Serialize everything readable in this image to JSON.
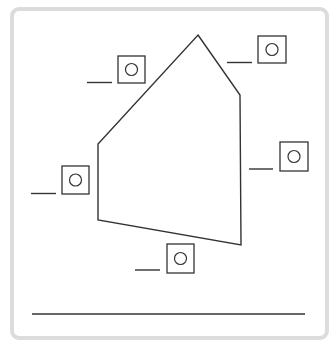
{
  "worksheet": {
    "frame": {
      "x": 10,
      "y": 7,
      "width": 319,
      "height": 333,
      "border_color": "#dcdcdc"
    },
    "stroke_color": "#333333",
    "polygon": {
      "name": "pentagon",
      "vertices": [
        [
          198,
          35
        ],
        [
          240,
          95
        ],
        [
          241,
          245
        ],
        [
          98,
          220
        ],
        [
          98,
          144
        ]
      ]
    },
    "angle_labels": [
      {
        "id": "top-left",
        "box": [
          118,
          56,
          27,
          27
        ],
        "circle": [
          131.5,
          69.5,
          6
        ],
        "blank": [
          87,
          82.5,
          112,
          82.5
        ],
        "answer": ""
      },
      {
        "id": "top-right",
        "box": [
          258,
          36,
          28,
          27
        ],
        "circle": [
          272,
          49.5,
          6
        ],
        "blank": [
          227,
          62.5,
          252,
          62.5
        ],
        "answer": ""
      },
      {
        "id": "right",
        "box": [
          280,
          142,
          28,
          29
        ],
        "circle": [
          294,
          156.5,
          6
        ],
        "blank": [
          249,
          169,
          273,
          169
        ],
        "answer": ""
      },
      {
        "id": "left",
        "box": [
          62,
          166,
          27,
          28
        ],
        "circle": [
          75.5,
          180,
          6
        ],
        "blank": [
          31,
          193.5,
          56,
          193.5
        ],
        "answer": ""
      },
      {
        "id": "bottom",
        "box": [
          167,
          244,
          27,
          29
        ],
        "circle": [
          180.5,
          258.5,
          6
        ],
        "blank": [
          135,
          270,
          160,
          270
        ],
        "answer": ""
      }
    ],
    "answer_line": {
      "x1": 32,
      "y1": 314,
      "x2": 305,
      "y2": 314,
      "answer": ""
    }
  }
}
